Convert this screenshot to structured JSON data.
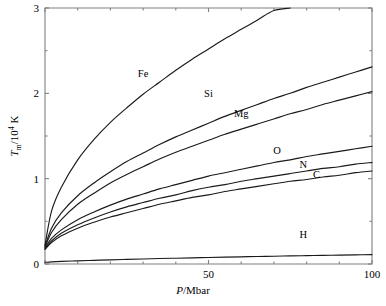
{
  "chart_data": {
    "type": "line",
    "title": "",
    "xlabel": "P/Mbar",
    "ylabel": "T_m/10^4 K",
    "xlabel_parts": {
      "symbol": "P",
      "rest": "/Mbar"
    },
    "ylabel_parts": {
      "symbol": "T",
      "subscript": "m",
      "rest": "/10",
      "exponent": "4",
      "unit": " K"
    },
    "xlim": [
      0,
      100
    ],
    "ylim": [
      0,
      3
    ],
    "xticks": [
      0,
      50,
      100
    ],
    "xticklabels": [
      "",
      "50",
      "100"
    ],
    "yticks": [
      0,
      1,
      2,
      3
    ],
    "yticklabels": [
      "0",
      "1",
      "2",
      "3"
    ],
    "minor_xticks": [
      10,
      20,
      30,
      40,
      60,
      70,
      80,
      90
    ],
    "minor_yticks": [
      0.5,
      1.5,
      2.5
    ],
    "grid": false,
    "legend": "inline-labels",
    "x": [
      0,
      2,
      5,
      10,
      15,
      20,
      25,
      30,
      35,
      40,
      45,
      50,
      55,
      60,
      65,
      70,
      75,
      80,
      85,
      90,
      95,
      100
    ],
    "series": [
      {
        "name": "Fe",
        "label": "Fe",
        "label_x": 30,
        "label_y": 2.19,
        "color": "#1a1a1a",
        "values": [
          0.22,
          0.62,
          0.9,
          1.22,
          1.46,
          1.66,
          1.83,
          1.99,
          2.13,
          2.27,
          2.4,
          2.52,
          2.64,
          2.75,
          2.86,
          2.97,
          3.0,
          null,
          null,
          null,
          null,
          null
        ]
      },
      {
        "name": "Si",
        "label": "Si",
        "label_x": 50,
        "label_y": 1.96,
        "color": "#1a1a1a",
        "values": [
          0.21,
          0.42,
          0.6,
          0.8,
          0.95,
          1.08,
          1.2,
          1.3,
          1.4,
          1.49,
          1.57,
          1.65,
          1.73,
          1.8,
          1.87,
          1.94,
          2.0,
          2.07,
          2.13,
          2.19,
          2.25,
          2.31
        ]
      },
      {
        "name": "Mg",
        "label": "Mg",
        "label_x": 60,
        "label_y": 1.72,
        "color": "#1a1a1a",
        "values": [
          0.2,
          0.37,
          0.52,
          0.7,
          0.83,
          0.95,
          1.05,
          1.14,
          1.23,
          1.31,
          1.38,
          1.45,
          1.52,
          1.58,
          1.64,
          1.7,
          1.76,
          1.81,
          1.87,
          1.92,
          1.97,
          2.02
        ]
      },
      {
        "name": "O",
        "label": "O",
        "label_x": 71,
        "label_y": 1.29,
        "color": "#1a1a1a",
        "values": [
          0.19,
          0.3,
          0.4,
          0.52,
          0.61,
          0.69,
          0.76,
          0.82,
          0.88,
          0.93,
          0.98,
          1.03,
          1.07,
          1.11,
          1.15,
          1.19,
          1.22,
          1.26,
          1.29,
          1.32,
          1.35,
          1.38
        ]
      },
      {
        "name": "N",
        "label": "N",
        "label_x": 79,
        "label_y": 1.13,
        "color": "#1a1a1a",
        "values": [
          0.18,
          0.27,
          0.36,
          0.46,
          0.54,
          0.61,
          0.67,
          0.72,
          0.77,
          0.81,
          0.86,
          0.9,
          0.93,
          0.97,
          1.0,
          1.03,
          1.06,
          1.09,
          1.12,
          1.14,
          1.17,
          1.19
        ]
      },
      {
        "name": "C",
        "label": "C",
        "label_x": 83,
        "label_y": 1.01,
        "color": "#1a1a1a",
        "values": [
          0.17,
          0.25,
          0.33,
          0.42,
          0.49,
          0.55,
          0.6,
          0.65,
          0.7,
          0.74,
          0.78,
          0.81,
          0.85,
          0.88,
          0.91,
          0.94,
          0.97,
          0.99,
          1.02,
          1.04,
          1.07,
          1.09
        ]
      },
      {
        "name": "H",
        "label": "H",
        "label_x": 79,
        "label_y": 0.3,
        "color": "#1a1a1a",
        "values": [
          0.02,
          0.025,
          0.03,
          0.037,
          0.043,
          0.049,
          0.054,
          0.059,
          0.064,
          0.068,
          0.072,
          0.076,
          0.08,
          0.084,
          0.088,
          0.091,
          0.095,
          0.098,
          0.101,
          0.104,
          0.107,
          0.11
        ]
      }
    ]
  }
}
